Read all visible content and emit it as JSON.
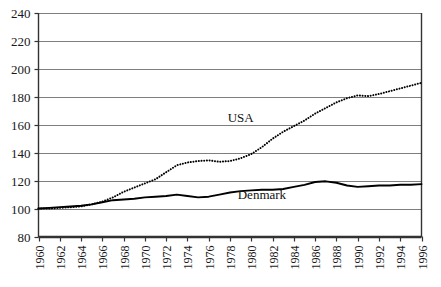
{
  "chart_data": {
    "type": "line",
    "title": "",
    "subtitle": "",
    "xlabel": "",
    "ylabel": "",
    "xlim": [
      1960,
      1996
    ],
    "ylim": [
      80,
      240
    ],
    "ytick_step": 20,
    "xtick_step": 2,
    "grid": true,
    "grid_axis": "y",
    "legend_position": "inline-annotation",
    "yticks": [
      80,
      100,
      120,
      140,
      160,
      180,
      200,
      220,
      240
    ],
    "ytick_labels": [
      "80",
      "100",
      "120",
      "140",
      "160",
      "180",
      "200",
      "220",
      "240"
    ],
    "xticks": [
      1960,
      1962,
      1964,
      1966,
      1968,
      1970,
      1972,
      1974,
      1976,
      1978,
      1980,
      1982,
      1984,
      1986,
      1988,
      1990,
      1992,
      1994,
      1996
    ],
    "xtick_labels": [
      "1960",
      "1962",
      "1964",
      "1966",
      "1968",
      "1970",
      "1972",
      "1974",
      "1976",
      "1978",
      "1980",
      "1982",
      "1984",
      "1986",
      "1988",
      "1990",
      "1992",
      "1994",
      "1996"
    ],
    "x": [
      1960,
      1961,
      1962,
      1963,
      1964,
      1965,
      1966,
      1967,
      1968,
      1969,
      1970,
      1971,
      1972,
      1973,
      1974,
      1975,
      1976,
      1977,
      1978,
      1979,
      1980,
      1981,
      1982,
      1983,
      1984,
      1985,
      1986,
      1987,
      1988,
      1989,
      1990,
      1991,
      1992,
      1993,
      1994,
      1995,
      1996
    ],
    "series": [
      {
        "name": "USA",
        "label": "USA",
        "style": "dotted",
        "color": "#000000",
        "values": [
          100,
          100,
          100.5,
          101,
          101.5,
          103,
          105,
          108,
          112,
          115,
          118,
          121,
          126,
          131,
          133,
          134,
          134.5,
          133.5,
          134,
          136,
          139,
          144,
          150,
          155,
          159,
          163,
          168,
          172,
          176,
          179,
          181,
          180.5,
          182,
          184,
          186,
          188,
          190
        ]
      },
      {
        "name": "Denmark",
        "label": "Denmark",
        "style": "solid",
        "color": "#000000",
        "values": [
          100,
          100.5,
          101,
          101.5,
          102,
          103,
          104.5,
          106,
          106.5,
          107,
          108,
          108.5,
          109,
          110,
          109,
          108,
          108.5,
          110,
          111.5,
          112.5,
          113,
          113.5,
          113.5,
          114,
          115.5,
          117,
          119,
          119.5,
          118.5,
          116.5,
          115.5,
          116,
          116.5,
          116.5,
          117,
          117,
          117.5
        ]
      }
    ],
    "annotations": [
      {
        "text": "USA",
        "x_value": 1979,
        "y_value": 162
      },
      {
        "text": "Denmark",
        "x_value": 1981,
        "y_value": 107
      }
    ]
  }
}
